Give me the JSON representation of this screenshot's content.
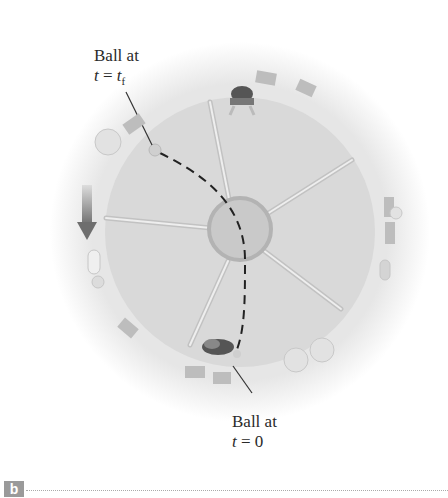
{
  "figure": {
    "panel_label": "b",
    "labels": {
      "final": {
        "line1": "Ball at",
        "eq_var": "t",
        "eq_sign": " = ",
        "eq_val": "t",
        "eq_sub": "f"
      },
      "initial": {
        "line1": "Ball at",
        "eq_var": "t",
        "eq_sign": " = ",
        "eq_val": "0"
      }
    },
    "colors": {
      "platform": "#d8d8d8",
      "halo": "#ececec",
      "hub": "#c9c9c9",
      "hub_ring": "#b0b0b0",
      "spokes": "#c4c4c4",
      "trajectory": "#222222",
      "arrow": "#777777"
    },
    "icons": [
      "person-icon",
      "ball-icon",
      "rotation-arrow-icon",
      "chair-icon",
      "shrub-icon"
    ]
  }
}
